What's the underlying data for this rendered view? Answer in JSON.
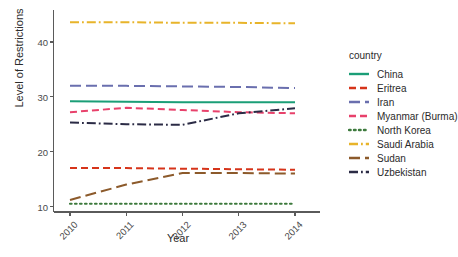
{
  "chart_data": {
    "type": "line",
    "title": "",
    "xlabel": "Year",
    "ylabel": "Level of Restrictions",
    "x": [
      2010,
      2011,
      2012,
      2013,
      2014
    ],
    "xtick_labels": [
      "2010",
      "2011",
      "2012",
      "2013",
      "2014"
    ],
    "ytick_labels": [
      "10",
      "20",
      "30",
      "40"
    ],
    "yticks": [
      10,
      20,
      30,
      40
    ],
    "xlim": [
      2010,
      2014
    ],
    "ylim": [
      9.6,
      44.6
    ],
    "grid": false,
    "legend_position": "right",
    "legend_title": "country",
    "series": [
      {
        "name": "China",
        "color": "#1b9e77",
        "dash": "solid",
        "values": [
          29.2,
          29.1,
          29.0,
          29.0,
          29.0
        ]
      },
      {
        "name": "Eritrea",
        "color": "#d6341a",
        "dash": "dashed",
        "values": [
          17.0,
          17.0,
          16.9,
          16.8,
          16.7
        ]
      },
      {
        "name": "Iran",
        "color": "#6a6fae",
        "dash": "longdash",
        "values": [
          32.0,
          32.0,
          31.9,
          31.8,
          31.6
        ]
      },
      {
        "name": "Myanmar (Burma)",
        "color": "#e8416b",
        "dash": "dashed",
        "values": [
          27.2,
          28.0,
          27.6,
          27.2,
          27.0
        ]
      },
      {
        "name": "North Korea",
        "color": "#3d7a3d",
        "dash": "dotted",
        "values": [
          10.5,
          10.5,
          10.5,
          10.5,
          10.5
        ]
      },
      {
        "name": "Saudi Arabia",
        "color": "#e8b42a",
        "dash": "dotdash",
        "values": [
          43.6,
          43.6,
          43.5,
          43.5,
          43.4
        ]
      },
      {
        "name": "Sudan",
        "color": "#8c5a2b",
        "dash": "longdash",
        "values": [
          11.2,
          14.0,
          16.1,
          16.1,
          16.0
        ]
      },
      {
        "name": "Uzbekistan",
        "color": "#2b2b45",
        "dash": "dotdash",
        "values": [
          25.3,
          25.0,
          24.9,
          27.0,
          27.9
        ]
      }
    ]
  }
}
